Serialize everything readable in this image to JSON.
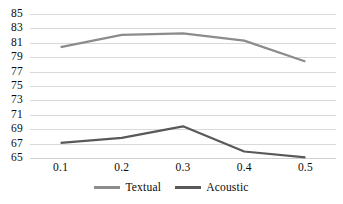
{
  "chart_data": {
    "type": "line",
    "title": "",
    "subtitle": "",
    "xlabel": "",
    "ylabel": "",
    "categories": [
      "0.1",
      "0.2",
      "0.3",
      "0.4",
      "0.5"
    ],
    "series": [
      {
        "name": "Textual",
        "color": "#8c8c8c",
        "values": [
          80.4,
          82.1,
          82.3,
          81.3,
          78.4
        ]
      },
      {
        "name": "Acoustic",
        "color": "#595959",
        "values": [
          67.1,
          67.8,
          69.4,
          65.9,
          65.1
        ]
      }
    ],
    "ylim": [
      65,
      85
    ],
    "ytick_step": 2,
    "yticks": [
      "85",
      "83",
      "81",
      "79",
      "77",
      "75",
      "73",
      "71",
      "69",
      "67",
      "65"
    ],
    "grid": true,
    "grid_color": "#d9d9d9",
    "legend_position": "bottom",
    "markers": false,
    "background": "#ffffff"
  },
  "legend": {
    "items": [
      {
        "label": "Textual",
        "color": "#8c8c8c"
      },
      {
        "label": "Acoustic",
        "color": "#595959"
      }
    ]
  }
}
